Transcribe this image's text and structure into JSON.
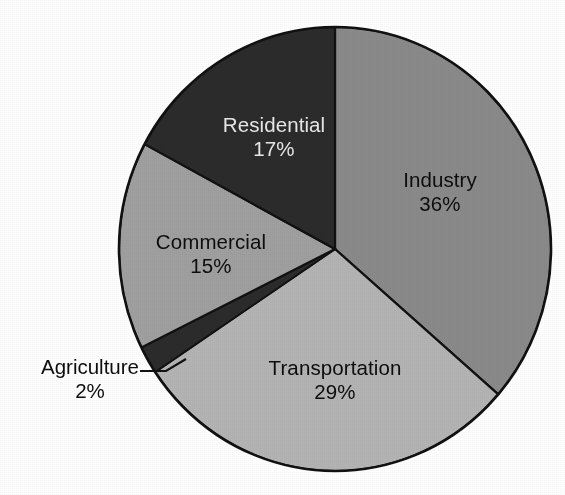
{
  "chart_data": {
    "type": "pie",
    "title": "",
    "subtitle": "",
    "xlabel": "",
    "ylabel": "",
    "legend_position": "none",
    "grid": false,
    "labels_inside_slices": true,
    "start_angle_deg": 0,
    "direction": "clockwise",
    "categories": [
      "Industry",
      "Transportation",
      "Agriculture",
      "Commercial",
      "Residential"
    ],
    "values": [
      36,
      29,
      2,
      15,
      17
    ],
    "unit": "%",
    "slices": [
      {
        "name": "Industry",
        "value": 36,
        "value_text": "36%",
        "color": "#8a8a8a",
        "label_color": "#0d0d0d",
        "label_placement": "inside",
        "start_deg": 0,
        "end_deg": 129.6
      },
      {
        "name": "Transportation",
        "value": 29,
        "value_text": "29%",
        "color": "#b4b4b4",
        "label_color": "#0d0d0d",
        "label_placement": "inside",
        "start_deg": 129.6,
        "end_deg": 234.0
      },
      {
        "name": "Agriculture",
        "value": 2,
        "value_text": "2%",
        "color": "#2b2b2b",
        "label_color": "#0d0d0d",
        "label_placement": "outside-callout",
        "start_deg": 234.0,
        "end_deg": 241.2
      },
      {
        "name": "Commercial",
        "value": 15,
        "value_text": "15%",
        "color": "#a0a0a0",
        "label_color": "#0d0d0d",
        "label_placement": "inside",
        "start_deg": 241.2,
        "end_deg": 295.2
      },
      {
        "name": "Residential",
        "value": 17,
        "value_text": "17%",
        "color": "#2b2b2b",
        "label_color": "#e8e8e8",
        "label_placement": "inside",
        "start_deg": 295.2,
        "end_deg": 360.0
      }
    ]
  },
  "colors": {
    "background": "#ffffff",
    "outline": "#111111",
    "industry": "#8a8a8a",
    "transportation": "#b4b4b4",
    "agriculture": "#2b2b2b",
    "commercial": "#a0a0a0",
    "residential": "#2b2b2b",
    "text_dark": "#0d0d0d",
    "text_light": "#e8e8e8"
  },
  "labels": {
    "industry": {
      "name": "Industry",
      "pct": "36%"
    },
    "transportation": {
      "name": "Transportation",
      "pct": "29%"
    },
    "commercial": {
      "name": "Commercial",
      "pct": "15%"
    },
    "residential": {
      "name": "Residential",
      "pct": "17%"
    },
    "agriculture": {
      "name": "Agriculture",
      "pct": "2%"
    }
  }
}
